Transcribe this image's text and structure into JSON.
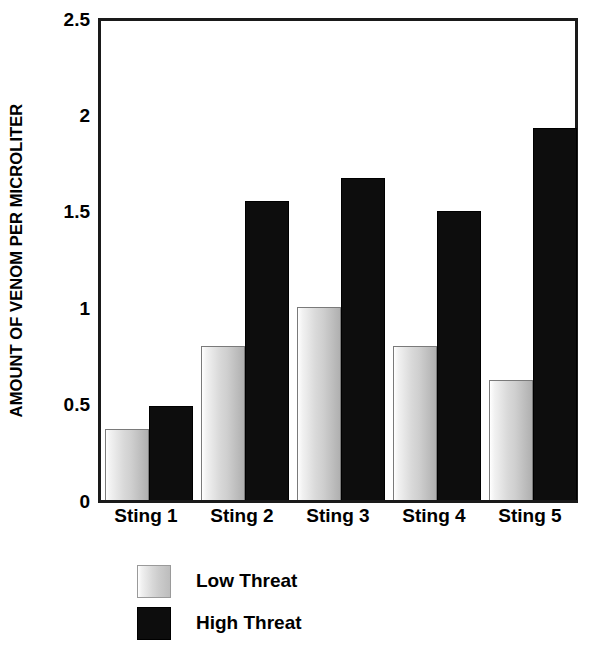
{
  "chart_data": {
    "type": "bar",
    "title": "",
    "xlabel": "",
    "ylabel": "AMOUNT OF VENOM PER MICROLITER",
    "ylim": [
      0,
      2.5
    ],
    "ytick_labels": [
      "0",
      "0.5",
      "1",
      "1.5",
      "2",
      "2.5"
    ],
    "ytick_values": [
      0,
      0.5,
      1,
      1.5,
      2,
      2.5
    ],
    "grid": false,
    "legend_position": "below-left",
    "categories": [
      "Sting 1",
      "Sting 2",
      "Sting 3",
      "Sting 4",
      "Sting 5"
    ],
    "series": [
      {
        "name": "Low Threat",
        "color": "#d0d0d0",
        "values": [
          0.37,
          0.8,
          1.0,
          0.8,
          0.62
        ]
      },
      {
        "name": "High Threat",
        "color": "#0d0d0d",
        "values": [
          0.49,
          1.55,
          1.67,
          1.5,
          1.93
        ]
      }
    ]
  },
  "legend": {
    "items": [
      {
        "label": "Low Threat",
        "swatch": "low"
      },
      {
        "label": "High Threat",
        "swatch": "high"
      }
    ]
  },
  "axes": {
    "frame_color": "#1a1a1a"
  }
}
